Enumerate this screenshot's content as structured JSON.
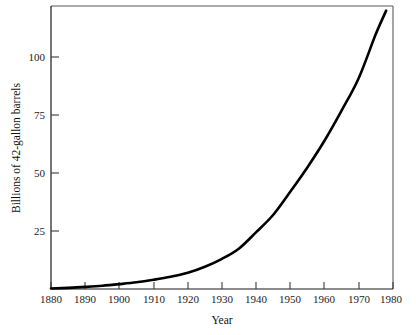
{
  "chart_data": {
    "type": "line",
    "title": "",
    "subtitle": "",
    "xlabel": "Year",
    "ylabel": "Billions of 42-gallon barrels",
    "xlim": [
      1880,
      1980
    ],
    "ylim": [
      0,
      122
    ],
    "grid": false,
    "legend": "none",
    "xticks": [
      1880,
      1890,
      1900,
      1910,
      1920,
      1930,
      1940,
      1950,
      1960,
      1970,
      1980
    ],
    "xticklabels": [
      "1880",
      "1890",
      "1900",
      "1910",
      "1920",
      "1930",
      "1940",
      "1950",
      "1960",
      "1970",
      "1980"
    ],
    "yticks": [
      25,
      50,
      75,
      100
    ],
    "yticklabels": [
      "25",
      "50",
      "75",
      "100"
    ],
    "series": [
      {
        "name": "Cumulative production",
        "color": "#000000",
        "x": [
          1880,
          1885,
          1890,
          1895,
          1900,
          1905,
          1910,
          1915,
          1920,
          1925,
          1930,
          1935,
          1940,
          1945,
          1950,
          1955,
          1960,
          1965,
          1970,
          1975,
          1978
        ],
        "values": [
          0.2,
          0.5,
          0.9,
          1.4,
          2.1,
          2.9,
          4.0,
          5.3,
          7.0,
          9.6,
          13.0,
          17.5,
          24.5,
          32.0,
          42.0,
          52.5,
          64.0,
          77.0,
          91.0,
          110.0,
          120.0
        ]
      }
    ],
    "annotations": []
  },
  "axis": {
    "x_title": "Year",
    "y_title": "Billions of 42-gallon barrels"
  },
  "colors": {
    "curve": "#000000",
    "frame": "#5a5a5a",
    "axis": "#1a1a1a",
    "background": "#ffffff",
    "text": "#1c1c1c"
  }
}
